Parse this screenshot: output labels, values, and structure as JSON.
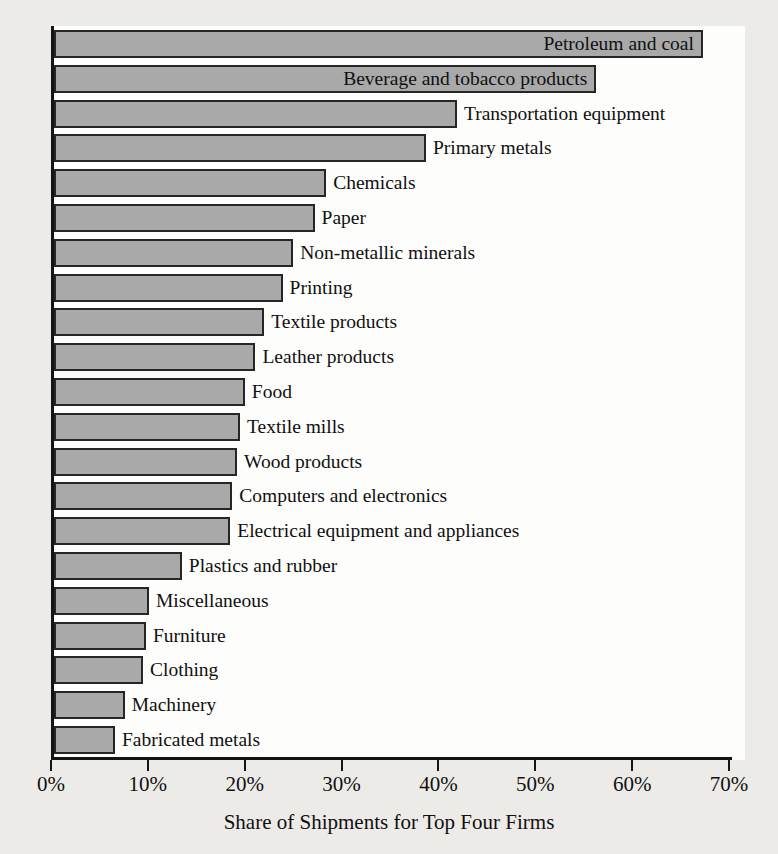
{
  "chart_data": {
    "type": "bar",
    "orientation": "horizontal",
    "title": "",
    "xlabel": "Share of Shipments for Top Four Firms",
    "ylabel": "",
    "xlim": [
      0,
      70
    ],
    "xticks": [
      0,
      10,
      20,
      30,
      40,
      50,
      60,
      70
    ],
    "xtick_labels": [
      "0%",
      "10%",
      "20%",
      "30%",
      "40%",
      "50%",
      "60%",
      "70%"
    ],
    "grid": false,
    "legend": null,
    "bar_color": "#a9a9a9",
    "bar_edge_color": "#262626",
    "background_color": "#edebe7",
    "plot_background_color": "#fdfdfc",
    "categories": [
      "Petroleum and coal",
      "Beverage and tobacco products",
      "Transportation equipment",
      "Primary metals",
      "Chemicals",
      "Paper",
      "Non-metallic minerals",
      "Printing",
      "Textile products",
      "Leather products",
      "Food",
      "Textile mills",
      "Wood products",
      "Computers and electronics",
      "Electrical equipment and appliances",
      "Plastics and rubber",
      "Miscellaneous",
      "Furniture",
      "Clothing",
      "Machinery",
      "Fabricated metals"
    ],
    "values": [
      67,
      56,
      41.6,
      38.4,
      28.1,
      26.9,
      24.7,
      23.6,
      21.7,
      20.8,
      19.7,
      19.2,
      18.9,
      18.4,
      18.2,
      13.2,
      9.8,
      9.5,
      9.2,
      7.3,
      6.3
    ],
    "label_placement": [
      "inside",
      "inside",
      "outside",
      "outside",
      "outside",
      "outside",
      "outside",
      "outside",
      "outside",
      "outside",
      "outside",
      "outside",
      "outside",
      "outside",
      "outside",
      "outside",
      "outside",
      "outside",
      "outside",
      "outside",
      "outside"
    ]
  }
}
